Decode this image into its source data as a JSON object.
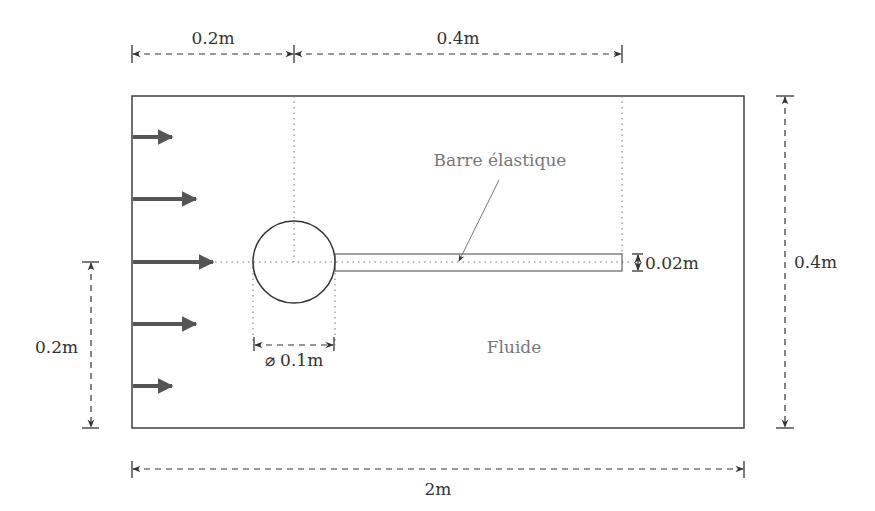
{
  "diagram": {
    "title": "",
    "domain_label": "Fluide",
    "bar_label": "Barre élastique",
    "dimensions": {
      "cylinder_offset": "0.2m",
      "bar_length": "0.4m",
      "domain_height": "0.4m",
      "inflow_height": "0.2m",
      "bar_thickness": "0.02m",
      "cylinder_diameter": "⌀ 0.1m",
      "domain_length": "2m"
    },
    "inflow_arrows": {
      "count": 5,
      "profile": "parabolic"
    },
    "colors": {
      "outline": "#333333",
      "arrow": "#555555",
      "label_gray": "#777777"
    }
  }
}
